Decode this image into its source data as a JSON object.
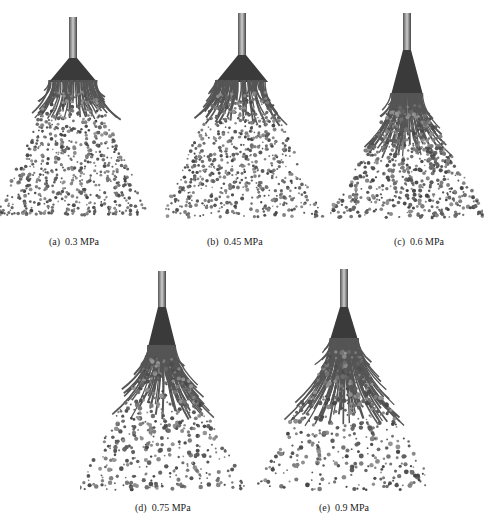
{
  "figure": {
    "panels": [
      {
        "id": "a",
        "label": "(a)",
        "value": "0.3 MPa"
      },
      {
        "id": "b",
        "label": "(b)",
        "value": "0.45 MPa"
      },
      {
        "id": "c",
        "label": "(c)",
        "value": "0.6 MPa"
      },
      {
        "id": "d",
        "label": "(d)",
        "value": "0.75 MPa"
      },
      {
        "id": "e",
        "label": "(e)",
        "value": "0.9 MPa"
      }
    ]
  }
}
